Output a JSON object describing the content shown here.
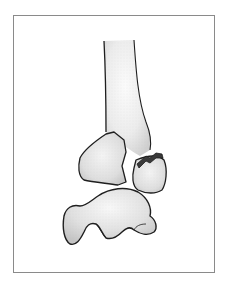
{
  "figure": {
    "description": "Line illustration of a fractured distal bone shaft with two displaced fragments and a separate bone below, inside a thin rectangular frame",
    "colors": {
      "background": "#ffffff",
      "frame": "#8a8a8a",
      "outline": "#1e1e1e",
      "bone_fill": "#e4e4e4",
      "bone_highlight": "#f6f6f6",
      "fracture_dark": "#3a3a3a"
    },
    "elements": [
      {
        "id": "shaft",
        "label": "bone shaft"
      },
      {
        "id": "fragment-left",
        "label": "left fracture fragment"
      },
      {
        "id": "fragment-right",
        "label": "right fracture fragment"
      },
      {
        "id": "fracture-line",
        "label": "fracture line"
      },
      {
        "id": "lower-bone",
        "label": "lower bone"
      }
    ]
  }
}
